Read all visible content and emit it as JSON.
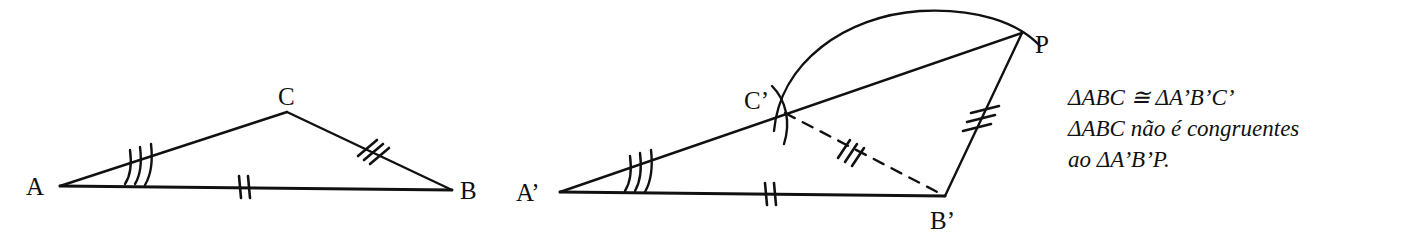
{
  "figure": {
    "type": "geometry-diagram",
    "stroke_color": "#111111",
    "background_color": "#ffffff",
    "left_triangle": {
      "name": "triangle-ABC",
      "vertices": [
        {
          "label": "A",
          "x": 60,
          "y": 186,
          "label_x": 26,
          "label_y": 174
        },
        {
          "label": "B",
          "x": 452,
          "y": 190,
          "label_x": 460,
          "label_y": 178
        },
        {
          "label": "C",
          "x": 287,
          "y": 112,
          "label_x": 278,
          "label_y": 84
        }
      ],
      "sides": [
        {
          "name": "side-AB",
          "from": "A",
          "to": "B",
          "style": "solid",
          "tick_count": 2
        },
        {
          "name": "side-AC",
          "from": "A",
          "to": "C",
          "style": "solid",
          "tick_count": 0
        },
        {
          "name": "side-CB",
          "from": "C",
          "to": "B",
          "style": "solid",
          "tick_count": 3
        }
      ],
      "angle_marks": [
        {
          "name": "angle-A",
          "vertex": "A",
          "arc_count": 3
        }
      ]
    },
    "right_figure": {
      "name": "triangle-A-prime-B-prime-C-prime-and-P",
      "vertices": [
        {
          "label": "A'",
          "x": 560,
          "y": 192,
          "label_x": 516,
          "label_y": 180
        },
        {
          "label": "B'",
          "x": 945,
          "y": 196,
          "label_x": 930,
          "label_y": 208
        },
        {
          "label": "C'",
          "x": 785,
          "y": 113,
          "label_x": 744,
          "label_y": 88
        },
        {
          "label": "P",
          "x": 1022,
          "y": 33,
          "label_x": 1035,
          "label_y": 32
        }
      ],
      "sides": [
        {
          "name": "side-A-prime-B-prime",
          "from": "A'",
          "to": "B'",
          "style": "solid",
          "tick_count": 2
        },
        {
          "name": "side-A-prime-P",
          "from": "A'",
          "to": "P",
          "style": "solid",
          "tick_count": 0
        },
        {
          "name": "side-C-prime-B-prime",
          "from": "C'",
          "to": "B'",
          "style": "dashed",
          "tick_count": 3
        },
        {
          "name": "side-B-prime-P",
          "from": "B'",
          "to": "P",
          "style": "solid",
          "tick_count": 3
        }
      ],
      "angle_marks": [
        {
          "name": "angle-A-prime",
          "vertex": "A'",
          "arc_count": 3
        }
      ],
      "arcs": [
        {
          "name": "construction-arc-large",
          "note": "arc centered at B' sweeping from C' over the top through P"
        },
        {
          "name": "construction-arc-small",
          "note": "short arc crossing line A'P at C'"
        }
      ]
    }
  },
  "caption": {
    "lines": [
      "ΔABC ≅  ΔA’B’C’",
      "ΔABC não é congruentes",
      "ao  ΔA’B’P."
    ],
    "line1": "ΔABC ≅  ΔA’B’C’",
    "line2": "ΔABC não é congruentes",
    "line3": "ao  ΔA’B’P."
  },
  "labels": {
    "A": "A",
    "B": "B",
    "C": "C",
    "A_prime": "A’",
    "B_prime": "B’",
    "C_prime": "C’",
    "P": "P"
  }
}
